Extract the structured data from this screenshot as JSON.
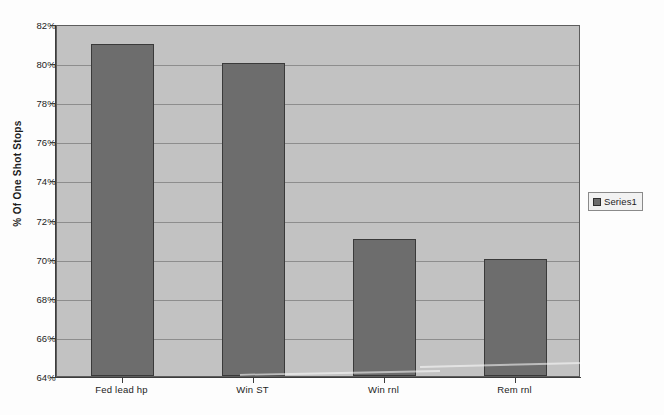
{
  "chart_data": {
    "type": "bar",
    "title": "",
    "xlabel": "",
    "ylabel": "% Of One Shot Stops",
    "categories": [
      "Fed lead hp",
      "Win ST",
      "Win rnl",
      "Rem rnl"
    ],
    "values": [
      81,
      80,
      71,
      70
    ],
    "value_suffix": "%",
    "ylim": [
      64,
      82
    ],
    "ytick_step": 2,
    "ytick_labels": [
      "82%",
      "80%",
      "78%",
      "76%",
      "74%",
      "72%",
      "70%",
      "68%",
      "66%",
      "64%"
    ],
    "ytick_values": [
      82,
      80,
      78,
      76,
      74,
      72,
      70,
      68,
      66,
      64
    ],
    "grid": true,
    "legend": {
      "position": "right",
      "entries": [
        {
          "label": "Series1",
          "color": "#6d6d6d"
        }
      ]
    },
    "series": [
      {
        "name": "Series1",
        "color": "#6d6d6d",
        "values": [
          81,
          80,
          71,
          70
        ]
      }
    ],
    "colors": {
      "bar_fill": "#6d6d6d",
      "bar_border": "#3a3a3a",
      "plot_background": "#c2c2c2",
      "gridline": "#8d8d8d",
      "axis": "#3c3c3c",
      "text": "#232323",
      "page_background": "#fdfdfd"
    }
  }
}
